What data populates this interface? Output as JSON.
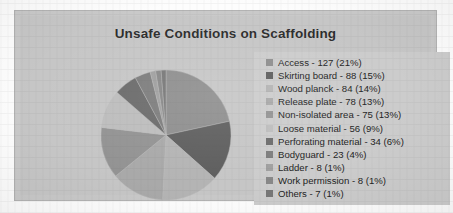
{
  "chart_data": {
    "type": "pie",
    "title": "Unsafe Conditions on Scaffolding",
    "xlabel": "",
    "ylabel": "",
    "legend_position": "right",
    "grid": false,
    "total": 588,
    "categories": [
      "Access",
      "Skirting board",
      "Wood planck",
      "Release plate",
      "Non-isolated area",
      "Loose material",
      "Perforating material",
      "Bodyguard",
      "Ladder",
      "Work permission",
      "Others"
    ],
    "values": [
      127,
      88,
      84,
      78,
      75,
      56,
      34,
      23,
      8,
      8,
      7
    ],
    "percentages": [
      21,
      15,
      14,
      13,
      13,
      9,
      6,
      4,
      1,
      1,
      1
    ],
    "slice_colors": [
      "#8e8e8e",
      "#5e5e5e",
      "#b4b4b4",
      "#a9a9a9",
      "#939393",
      "#bdbdbd",
      "#6b6b6b",
      "#7d7d7d",
      "#a0a0a0",
      "#888888",
      "#777777"
    ],
    "labels": [
      "Access - 127 (21%)",
      "Skirting board - 88 (15%)",
      "Wood planck - 84 (14%)",
      "Release plate - 78 (13%)",
      "Non-isolated area - 75 (13%)",
      "Loose material - 56 (9%)",
      "Perforating material - 34 (6%)",
      "Bodyguard - 23 (4%)",
      "Ladder - 8 (1%)",
      "Work permission - 8 (1%)",
      "Others - 7 (1%)"
    ]
  },
  "legend": {
    "items": [
      {
        "label": "Access - 127 (21%)",
        "color": "#8e8e8e"
      },
      {
        "label": "Skirting board - 88 (15%)",
        "color": "#5e5e5e"
      },
      {
        "label": "Wood planck - 84 (14%)",
        "color": "#b4b4b4"
      },
      {
        "label": "Release plate - 78 (13%)",
        "color": "#a9a9a9"
      },
      {
        "label": "Non-isolated area - 75 (13%)",
        "color": "#939393"
      },
      {
        "label": "Loose material - 56 (9%)",
        "color": "#bdbdbd"
      },
      {
        "label": "Perforating material - 34 (6%)",
        "color": "#6b6b6b"
      },
      {
        "label": "Bodyguard - 23 (4%)",
        "color": "#7d7d7d"
      },
      {
        "label": "Ladder - 8 (1%)",
        "color": "#a0a0a0"
      },
      {
        "label": "Work permission - 8 (1%)",
        "color": "#888888"
      },
      {
        "label": "Others - 7 (1%)",
        "color": "#777777"
      }
    ]
  },
  "theme": {
    "frame_fill": "#c9c9c9",
    "frame_border": "#b3b3b3",
    "legend_fill": "#cccccc",
    "title_color": "#2b2b2b",
    "text_color": "#232323"
  }
}
